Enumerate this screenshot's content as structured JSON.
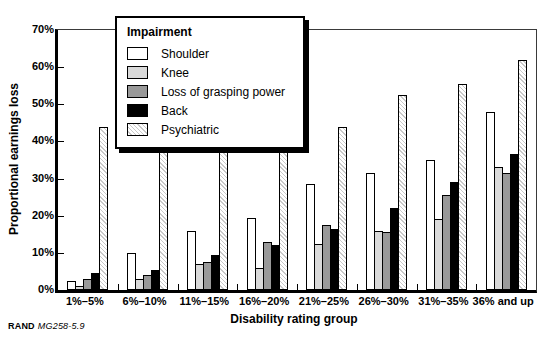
{
  "footer": {
    "brand": "RAND",
    "doc_id": "MG258-5.9"
  },
  "chart_data": {
    "type": "bar",
    "title": "",
    "xlabel": "Disability rating group",
    "ylabel": "Proportional earnings loss",
    "ylim": [
      0,
      70
    ],
    "ytick_step": 10,
    "ytick_labels": [
      "0%",
      "10%",
      "20%",
      "30%",
      "40%",
      "50%",
      "60%",
      "70%"
    ],
    "grid": "off",
    "legend_title": "Impairment",
    "legend_position": "top-left-inside",
    "categories": [
      "1%–5%",
      "6%–10%",
      "11%–15%",
      "16%–20%",
      "21%–25%",
      "26%–30%",
      "31%–35%",
      "36% and up"
    ],
    "series": [
      {
        "name": "Shoulder",
        "fill": "#ffffff",
        "pattern": "solid",
        "values": [
          2.5,
          10,
          16,
          19.5,
          28.5,
          31.5,
          35,
          48
        ]
      },
      {
        "name": "Knee",
        "fill": "#d9d9d9",
        "pattern": "solid",
        "values": [
          1,
          3,
          7,
          6,
          12.5,
          16,
          19,
          33
        ]
      },
      {
        "name": "Loss of grasping power",
        "fill": "#999999",
        "pattern": "solid",
        "values": [
          3,
          4,
          7.5,
          13,
          17.5,
          15.5,
          25.5,
          31.5
        ]
      },
      {
        "name": "Back",
        "fill": "#000000",
        "pattern": "solid",
        "values": [
          4.5,
          5.5,
          9.5,
          12,
          16.5,
          22,
          29,
          36.5
        ]
      },
      {
        "name": "Psychiatric",
        "fill": "#ffffff",
        "pattern": "hatch",
        "values": [
          44,
          39,
          40.5,
          43.5,
          44,
          52.5,
          55.5,
          62
        ]
      }
    ],
    "colors": {
      "outline": "#000000",
      "hatch_line": "#c9c9c9",
      "background": "#ffffff"
    }
  }
}
